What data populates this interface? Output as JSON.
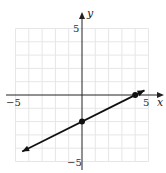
{
  "chart_data": {
    "type": "line",
    "title": "",
    "xlabel": "x",
    "ylabel": "y",
    "xlim": [
      -5,
      5
    ],
    "ylim": [
      -5,
      5
    ],
    "grid": true,
    "tick_labels": {
      "x_neg": "−5",
      "x_pos": "5",
      "y_pos": "5",
      "y_neg": "−5"
    },
    "series": [
      {
        "name": "line",
        "equation": "y = 0.5x - 2",
        "slope": 0.5,
        "intercept": -2,
        "x": [
          -4.5,
          4.7
        ],
        "y": [
          -4.25,
          0.35
        ],
        "arrows": "both"
      }
    ],
    "points": [
      {
        "x": 0,
        "y": -2
      },
      {
        "x": 4,
        "y": 0
      }
    ]
  }
}
